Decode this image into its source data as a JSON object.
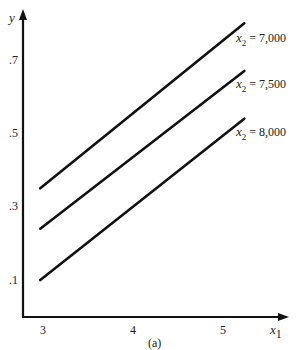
{
  "chart_data": {
    "type": "line",
    "title": "",
    "caption": "(a)",
    "xlabel": "x1",
    "ylabel": "y",
    "x_ticks": [
      "3",
      "4",
      "5"
    ],
    "y_ticks": [
      ".1",
      ".3",
      ".5",
      ".7"
    ],
    "xlim": [
      2.75,
      5.5
    ],
    "ylim": [
      0.0,
      0.82
    ],
    "grid": false,
    "legend": "inline labels at line ends",
    "series": [
      {
        "name": "x2 = 7,000",
        "label_var": "x",
        "label_sub": "2",
        "label_rest": " = 7,000",
        "x": [
          2.97,
          5.2
        ],
        "y": [
          0.35,
          0.8
        ]
      },
      {
        "name": "x2 = 7,500",
        "label_var": "x",
        "label_sub": "2",
        "label_rest": " = 7,500",
        "x": [
          2.97,
          5.2
        ],
        "y": [
          0.24,
          0.67
        ]
      },
      {
        "name": "x2 = 8,000",
        "label_var": "x",
        "label_sub": "2",
        "label_rest": " = 8,000",
        "x": [
          2.97,
          5.2
        ],
        "y": [
          0.1,
          0.54
        ]
      }
    ]
  },
  "axes": {
    "x_label_var": "x",
    "x_label_sub": "1",
    "y_label": "y",
    "caption": "(a)"
  }
}
